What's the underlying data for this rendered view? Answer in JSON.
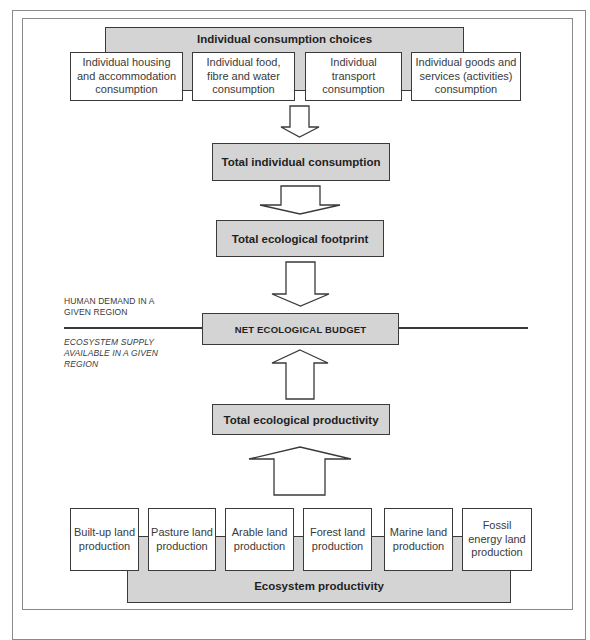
{
  "diagram": {
    "top_group": {
      "title": "Individual consumption choices",
      "items": [
        {
          "label": "Individual housing and accommodation consumption"
        },
        {
          "label": "Individual food, fibre and water consumption"
        },
        {
          "label": "Individual transport consumption"
        },
        {
          "label": "Individual goods and services (activities) consumption"
        }
      ]
    },
    "flow": {
      "total_individual_consumption": "Total individual consumption",
      "total_ecological_footprint": "Total ecological footprint",
      "net_ecological_budget": "NET ECOLOGICAL BUDGET",
      "total_ecological_productivity": "Total ecological productivity"
    },
    "region_labels": {
      "demand": "HUMAN DEMAND IN A GIVEN REGION",
      "supply": "ECOSYSTEM SUPPLY AVAILABLE IN A GIVEN REGION"
    },
    "bottom_group": {
      "title": "Ecosystem productivity",
      "items": [
        {
          "label": "Built-up land production"
        },
        {
          "label": "Pasture land production"
        },
        {
          "label": "Arable land production"
        },
        {
          "label": "Forest land production"
        },
        {
          "label": "Marine land production"
        },
        {
          "label": "Fossil energy land production"
        }
      ]
    },
    "colors": {
      "box_fill_gray": "#d4d4d4",
      "box_fill_white": "#ffffff",
      "stroke": "#3a3a3a",
      "frame": "#8a8a8a"
    }
  }
}
